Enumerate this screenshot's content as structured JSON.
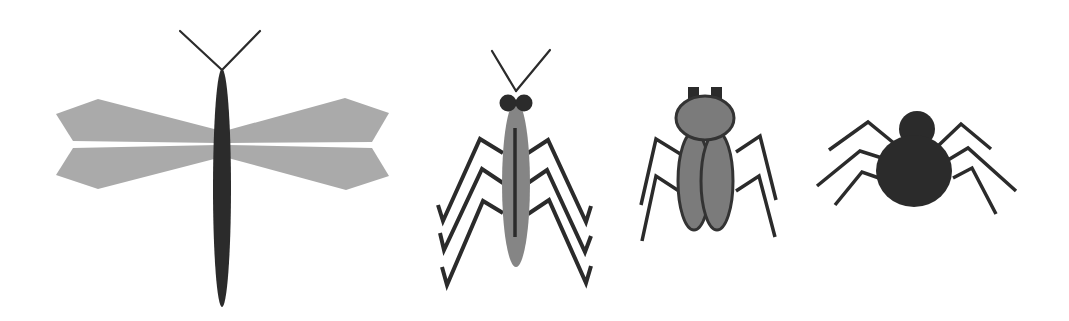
{
  "figure": {
    "description": "Four simplified insect/arachnid illustrations in grayscale",
    "width": 1069,
    "height": 321
  },
  "colors": {
    "background": "#ffffff",
    "wing": "#aaaaaa",
    "dark": "#2b2b2b",
    "outline": "#333333",
    "mid_gray": "#858585",
    "beetle_fill": "#7b7b7b"
  },
  "creatures": [
    {
      "id": "dragonfly",
      "name": "dragonfly"
    },
    {
      "id": "mantis",
      "name": "mantis"
    },
    {
      "id": "beetle",
      "name": "beetle"
    },
    {
      "id": "spider",
      "name": "spider"
    }
  ]
}
